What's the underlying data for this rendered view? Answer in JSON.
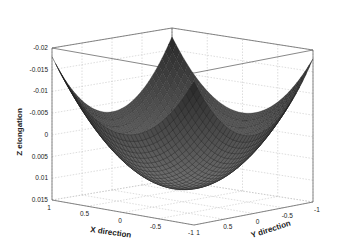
{
  "chart_data": {
    "type": "surface3d",
    "title": "",
    "xlabel": "X direction",
    "ylabel": "Y direction",
    "zlabel": "Z elongation",
    "x_ticks": [
      "1",
      "0.5",
      "0",
      "-0.5",
      "-1"
    ],
    "y_ticks": [
      "1",
      "0.5",
      "0",
      "-0.5",
      "-1"
    ],
    "z_ticks": [
      "-0.02",
      "-0.015",
      "-0.01",
      "-0.005",
      "0",
      "0.005",
      "0.01",
      "0.015"
    ],
    "xlim": [
      -1,
      1
    ],
    "ylim": [
      -1,
      1
    ],
    "zlim": [
      -0.02,
      0.015
    ],
    "z_reversed": true,
    "grid": true,
    "surface": {
      "description": "Bowl-shaped (paraboloid-like) surface, lowest at center (~0.012), rising to ~-0.018 at corners",
      "center_value": 0.012,
      "corner_value": -0.018,
      "colormap": "gray"
    }
  }
}
